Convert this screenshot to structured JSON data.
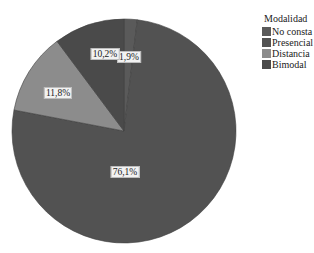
{
  "chart_data": {
    "type": "pie",
    "title": "",
    "legend_title": "Modalidad",
    "legend_position": "right-top",
    "start_angle_deg": 0,
    "direction": "clockwise",
    "categories": [
      "No consta",
      "Presencial",
      "Distancia",
      "Bimodal"
    ],
    "values": [
      1.9,
      76.1,
      11.8,
      10.2
    ],
    "labels": [
      "1,9%",
      "76,1%",
      "11,8%",
      "10,2%"
    ],
    "colors": [
      "#5a5a5a",
      "#525252",
      "#8c8c8c",
      "#4a4a4a"
    ],
    "center": [
      124,
      131
    ],
    "radius": 112
  }
}
